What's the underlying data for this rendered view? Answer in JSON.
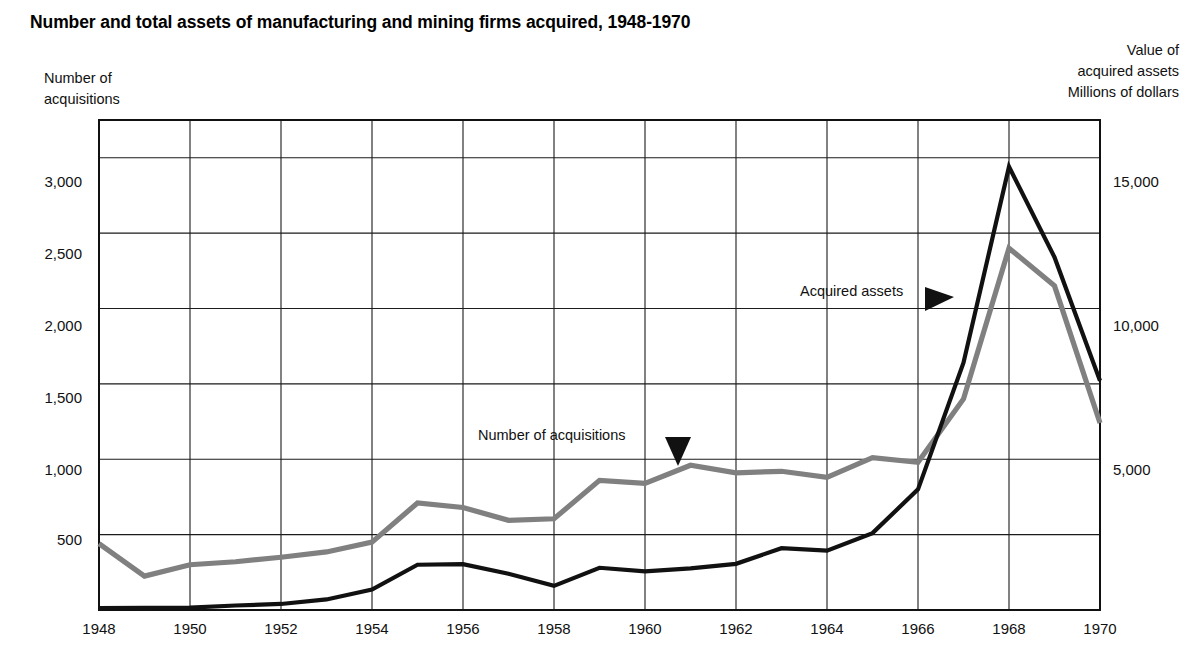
{
  "title": "Number and total assets of manufacturing and mining firms acquired, 1948-1970",
  "left_axis": {
    "caption_line1": "Number of",
    "caption_line2": "acquisitions",
    "ticks": [
      "500",
      "1,000",
      "1,500",
      "2,000",
      "2,500",
      "3,000"
    ],
    "tick_values": [
      500,
      1000,
      1500,
      2000,
      2500,
      3000
    ]
  },
  "right_axis": {
    "caption_line1": "Value of",
    "caption_line2": "acquired assets",
    "caption_line3": "Millions of dollars",
    "ticks": [
      "5,000",
      "10,000",
      "15,000"
    ],
    "tick_values": [
      5000,
      10000,
      15000
    ]
  },
  "x_axis": {
    "ticks": [
      "1948",
      "1950",
      "1952",
      "1954",
      "1956",
      "1958",
      "1960",
      "1962",
      "1964",
      "1966",
      "1968",
      "1970"
    ]
  },
  "annotations": {
    "acquisitions_label": "Number of acquisitions",
    "assets_label": "Acquired assets"
  },
  "colors": {
    "acquisitions_line": "#808080",
    "assets_line": "#111111",
    "grid": "#1b1b1b",
    "background": "#ffffff"
  },
  "chart_data": {
    "type": "line",
    "title": "Number and total assets of manufacturing and mining firms acquired, 1948-1970",
    "xlabel": "",
    "ylabel": "Number of acquisitions",
    "y2label": "Value of acquired assets (Millions of dollars)",
    "x": [
      1948,
      1949,
      1950,
      1951,
      1952,
      1953,
      1954,
      1955,
      1956,
      1957,
      1958,
      1959,
      1960,
      1961,
      1962,
      1963,
      1964,
      1965,
      1966,
      1967,
      1968,
      1969,
      1970
    ],
    "xlim": [
      1948,
      1970
    ],
    "ylim": [
      0,
      3250
    ],
    "y2lim": [
      0,
      16250
    ],
    "grid": true,
    "legend": "annotated-inline",
    "series": [
      {
        "name": "Number of acquisitions",
        "axis": "left",
        "color": "#808080",
        "unit": "acquisitions",
        "values": [
          440,
          225,
          300,
          320,
          350,
          385,
          450,
          710,
          680,
          595,
          605,
          860,
          840,
          960,
          910,
          920,
          880,
          1010,
          980,
          1400,
          2400,
          2150,
          1240
        ]
      },
      {
        "name": "Acquired assets",
        "axis": "right",
        "color": "#111111",
        "unit": "millions of dollars",
        "values": [
          60,
          70,
          80,
          150,
          200,
          350,
          680,
          1500,
          1520,
          1200,
          800,
          1400,
          1280,
          1380,
          1530,
          2050,
          1970,
          2550,
          4000,
          8200,
          14700,
          11700,
          7600
        ]
      }
    ],
    "annotations": [
      {
        "text": "Number of acquisitions",
        "points_to": {
          "x": 1961,
          "series": "Number of acquisitions"
        }
      },
      {
        "text": "Acquired assets",
        "points_to": {
          "x": 1967,
          "series": "Acquired assets"
        }
      }
    ]
  }
}
